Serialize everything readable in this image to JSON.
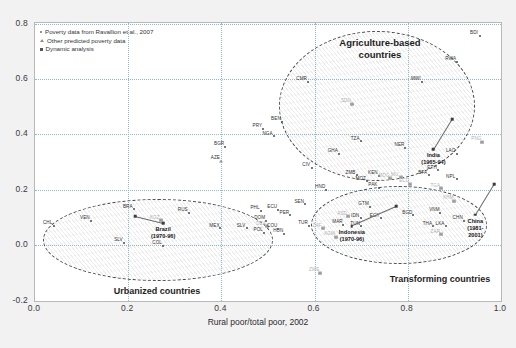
{
  "chart_data": {
    "type": "scatter",
    "title": "",
    "xlabel": "Rural poor/total poor, 2002",
    "ylabel": "",
    "xlim": [
      0.0,
      1.0
    ],
    "ylim": [
      -0.2,
      0.8
    ],
    "xticks": [
      "0.0",
      "0.2",
      "0.4",
      "0.6",
      "0.8",
      "1.0"
    ],
    "yticks": [
      "-0.2",
      "0.0",
      "0.2",
      "0.4",
      "0.6",
      "0.8"
    ],
    "grid": true,
    "legend_position": "top-left",
    "legend": [
      {
        "marker": "dot",
        "label": "Poverty data from Ravallion et al., 2007"
      },
      {
        "marker": "triangle",
        "label": "Other predicted poverty data"
      },
      {
        "marker": "square",
        "label": "Dynamic analysis"
      }
    ],
    "groups": [
      {
        "name": "Agriculture-based countries",
        "label_x": 0.735,
        "label_y": 0.735
      },
      {
        "name": "Transforming countries",
        "label_x": 0.855,
        "label_y": -0.045
      },
      {
        "name": "Urbanized countries",
        "label_x": 0.235,
        "label_y": -0.115
      }
    ],
    "annotations": [
      {
        "name": "India",
        "period": "(1965-94)",
        "x": 0.855,
        "y": 0.345,
        "from_x": 0.895,
        "from_y": 0.455
      },
      {
        "name": "China",
        "period": "(1981-2001)",
        "x": 0.945,
        "y": 0.11,
        "from_x": 0.985,
        "from_y": 0.22
      },
      {
        "name": "Indonesia",
        "period": "(1970-96)",
        "x": 0.68,
        "y": 0.07,
        "from_x": 0.775,
        "from_y": 0.14
      },
      {
        "name": "Brazil",
        "period": "(1970-96)",
        "x": 0.275,
        "y": 0.08,
        "from_x": 0.215,
        "from_y": 0.105
      }
    ],
    "points": [
      {
        "code": "BDI",
        "x": 0.955,
        "y": 0.755,
        "marker": "dot"
      },
      {
        "code": "RWA",
        "x": 0.905,
        "y": 0.66,
        "marker": "dot"
      },
      {
        "code": "MWI",
        "x": 0.83,
        "y": 0.588,
        "marker": "dot"
      },
      {
        "code": "CMR",
        "x": 0.585,
        "y": 0.588,
        "marker": "dot"
      },
      {
        "code": "SDN",
        "x": 0.68,
        "y": 0.51,
        "marker": "triangle",
        "faint": true
      },
      {
        "code": "BEN",
        "x": 0.53,
        "y": 0.445,
        "marker": "dot"
      },
      {
        "code": "PRY",
        "x": 0.49,
        "y": 0.42,
        "marker": "dot"
      },
      {
        "code": "NGA",
        "x": 0.512,
        "y": 0.392,
        "marker": "dot"
      },
      {
        "code": "TZA",
        "x": 0.7,
        "y": 0.375,
        "marker": "dot"
      },
      {
        "code": "NER",
        "x": 0.795,
        "y": 0.352,
        "marker": "dot"
      },
      {
        "code": "LAO",
        "x": 0.905,
        "y": 0.33,
        "marker": "dot"
      },
      {
        "code": "PNG",
        "x": 0.96,
        "y": 0.372,
        "marker": "triangle",
        "faint": true
      },
      {
        "code": "GHA",
        "x": 0.652,
        "y": 0.33,
        "marker": "dot"
      },
      {
        "code": "BGR",
        "x": 0.408,
        "y": 0.355,
        "marker": "dot"
      },
      {
        "code": "AZE",
        "x": 0.4,
        "y": 0.305,
        "marker": "triangle"
      },
      {
        "code": "CIV",
        "x": 0.595,
        "y": 0.28,
        "marker": "dot"
      },
      {
        "code": "ETH",
        "x": 0.865,
        "y": 0.27,
        "marker": "dot"
      },
      {
        "code": "BFA",
        "x": 0.845,
        "y": 0.252,
        "marker": "dot"
      },
      {
        "code": "NPL",
        "x": 0.905,
        "y": 0.238,
        "marker": "dot"
      },
      {
        "code": "ZMB",
        "x": 0.69,
        "y": 0.252,
        "marker": "dot"
      },
      {
        "code": "KEN",
        "x": 0.738,
        "y": 0.25,
        "marker": "dot"
      },
      {
        "code": "MOZ",
        "x": 0.712,
        "y": 0.23,
        "marker": "dot"
      },
      {
        "code": "MU",
        "x": 0.785,
        "y": 0.245,
        "marker": "triangle",
        "faint": true
      },
      {
        "code": "MDG",
        "x": 0.762,
        "y": 0.242,
        "marker": "triangle",
        "faint": true
      },
      {
        "code": "PAK",
        "x": 0.738,
        "y": 0.208,
        "marker": "dot"
      },
      {
        "code": "ECD",
        "x": 0.805,
        "y": 0.222,
        "marker": "triangle",
        "faint": true
      },
      {
        "code": "TGA",
        "x": 0.872,
        "y": 0.205,
        "marker": "triangle",
        "faint": true
      },
      {
        "code": "HND",
        "x": 0.625,
        "y": 0.2,
        "marker": "dot"
      },
      {
        "code": "KHM",
        "x": 0.9,
        "y": 0.16,
        "marker": "triangle",
        "faint": true
      },
      {
        "code": "SEN",
        "x": 0.58,
        "y": 0.148,
        "marker": "dot"
      },
      {
        "code": "GTM",
        "x": 0.718,
        "y": 0.138,
        "marker": "dot"
      },
      {
        "code": "VNM",
        "x": 0.87,
        "y": 0.118,
        "marker": "dot"
      },
      {
        "code": "CHN",
        "x": 0.92,
        "y": 0.088,
        "marker": "dot"
      },
      {
        "code": "BGD",
        "x": 0.812,
        "y": 0.108,
        "marker": "dot"
      },
      {
        "code": "IDN",
        "x": 0.7,
        "y": 0.098,
        "marker": "dot"
      },
      {
        "code": "EGY",
        "x": 0.742,
        "y": 0.098,
        "marker": "dot"
      },
      {
        "code": "MAR",
        "x": 0.662,
        "y": 0.075,
        "marker": "dot"
      },
      {
        "code": "ASD",
        "x": 0.672,
        "y": 0.105,
        "marker": "triangle",
        "faint": true
      },
      {
        "code": "TUN",
        "x": 0.7,
        "y": 0.068,
        "marker": "dot"
      },
      {
        "code": "THA",
        "x": 0.855,
        "y": 0.068,
        "marker": "dot"
      },
      {
        "code": "LKA",
        "x": 0.882,
        "y": 0.068,
        "marker": "dot"
      },
      {
        "code": "ZAR",
        "x": 0.872,
        "y": 0.04,
        "marker": "triangle",
        "faint": true
      },
      {
        "code": "KGM",
        "x": 0.645,
        "y": 0.03,
        "marker": "triangle",
        "faint": true
      },
      {
        "code": "ZWE",
        "x": 0.612,
        "y": -0.098,
        "marker": "triangle",
        "faint": true
      },
      {
        "code": "PHL",
        "x": 0.485,
        "y": 0.125,
        "marker": "dot"
      },
      {
        "code": "ECU",
        "x": 0.522,
        "y": 0.128,
        "marker": "dot"
      },
      {
        "code": "PER",
        "x": 0.548,
        "y": 0.108,
        "marker": "dot"
      },
      {
        "code": "DOM",
        "x": 0.495,
        "y": 0.088,
        "marker": "dot"
      },
      {
        "code": "DZA",
        "x": 0.498,
        "y": 0.068,
        "marker": "triangle",
        "faint": true
      },
      {
        "code": "TUR",
        "x": 0.588,
        "y": 0.07,
        "marker": "dot"
      },
      {
        "code": "ZAF",
        "x": 0.618,
        "y": 0.062,
        "marker": "triangle",
        "faint": true
      },
      {
        "code": "SLV",
        "x": 0.455,
        "y": 0.062,
        "marker": "dot"
      },
      {
        "code": "COU",
        "x": 0.522,
        "y": 0.06,
        "marker": "dot"
      },
      {
        "code": "POL",
        "x": 0.492,
        "y": 0.045,
        "marker": "dot"
      },
      {
        "code": "HUN",
        "x": 0.535,
        "y": 0.042,
        "marker": "dot"
      },
      {
        "code": "MEX",
        "x": 0.398,
        "y": 0.062,
        "marker": "dot"
      },
      {
        "code": "RUS",
        "x": 0.33,
        "y": 0.118,
        "marker": "dot"
      },
      {
        "code": "KGZ",
        "x": 0.27,
        "y": 0.09,
        "marker": "triangle",
        "faint": true
      },
      {
        "code": "BRA",
        "x": 0.212,
        "y": 0.13,
        "marker": "dot"
      },
      {
        "code": "VEN",
        "x": 0.12,
        "y": 0.088,
        "marker": "dot"
      },
      {
        "code": "CHL",
        "x": 0.04,
        "y": 0.07,
        "marker": "dot"
      },
      {
        "code": "COL",
        "x": 0.275,
        "y": -0.002,
        "marker": "dot"
      },
      {
        "code": "SLV",
        "x": 0.192,
        "y": 0.01,
        "marker": "dot"
      }
    ]
  }
}
